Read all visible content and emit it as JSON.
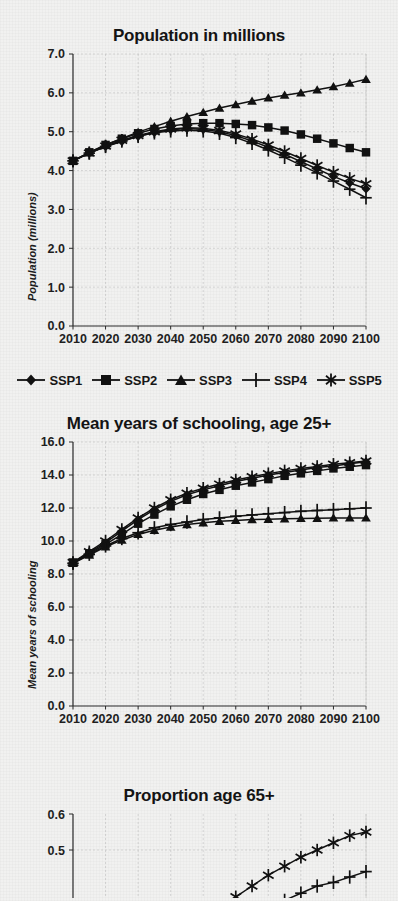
{
  "figure": {
    "style": "black-and-white scanned line chart figure",
    "background_color": "#f1f1f0",
    "ink_color": "#111111"
  },
  "legend": {
    "position": "below first panel",
    "items": [
      {
        "label": "SSP1",
        "marker": "diamond"
      },
      {
        "label": "SSP2",
        "marker": "square"
      },
      {
        "label": "SSP3",
        "marker": "triangle"
      },
      {
        "label": "SSP4",
        "marker": "plus"
      },
      {
        "label": "SSP5",
        "marker": "asterisk"
      }
    ]
  },
  "chart_data": [
    {
      "type": "line",
      "title": "Population in millions",
      "xlabel": "",
      "ylabel": "Population (millions)",
      "x": [
        2010,
        2015,
        2020,
        2025,
        2030,
        2035,
        2040,
        2045,
        2050,
        2055,
        2060,
        2065,
        2070,
        2075,
        2080,
        2085,
        2090,
        2095,
        2100
      ],
      "xlim": [
        2010,
        2100
      ],
      "ylim": [
        0.0,
        7.0
      ],
      "yticks": [
        "0.0",
        "1.0",
        "2.0",
        "3.0",
        "4.0",
        "5.0",
        "6.0",
        "7.0"
      ],
      "xticks": [
        "2010",
        "2020",
        "2030",
        "2040",
        "2050",
        "2060",
        "2070",
        "2080",
        "2090",
        "2100"
      ],
      "grid": true,
      "series": [
        {
          "name": "SSP1",
          "marker": "diamond",
          "values": [
            4.25,
            4.45,
            4.62,
            4.75,
            4.88,
            4.98,
            5.05,
            5.08,
            5.06,
            5.0,
            4.9,
            4.76,
            4.6,
            4.42,
            4.23,
            4.04,
            3.85,
            3.68,
            3.53
          ]
        },
        {
          "name": "SSP2",
          "marker": "square",
          "values": [
            4.25,
            4.47,
            4.66,
            4.82,
            4.96,
            5.07,
            5.15,
            5.2,
            5.22,
            5.22,
            5.2,
            5.17,
            5.11,
            5.03,
            4.93,
            4.82,
            4.7,
            4.58,
            4.47
          ]
        },
        {
          "name": "SSP3",
          "marker": "triangle",
          "values": [
            4.25,
            4.47,
            4.66,
            4.83,
            4.99,
            5.13,
            5.27,
            5.39,
            5.5,
            5.61,
            5.7,
            5.79,
            5.87,
            5.94,
            6.0,
            6.08,
            6.16,
            6.25,
            6.35
          ]
        },
        {
          "name": "SSP4",
          "marker": "plus",
          "values": [
            4.25,
            4.45,
            4.62,
            4.76,
            4.88,
            4.97,
            5.02,
            5.04,
            5.02,
            4.96,
            4.85,
            4.7,
            4.53,
            4.34,
            4.14,
            3.94,
            3.73,
            3.52,
            3.3
          ]
        },
        {
          "name": "SSP5",
          "marker": "asterisk",
          "values": [
            4.25,
            4.45,
            4.63,
            4.78,
            4.9,
            5.0,
            5.07,
            5.1,
            5.09,
            5.03,
            4.94,
            4.81,
            4.66,
            4.49,
            4.31,
            4.13,
            3.96,
            3.8,
            3.66
          ]
        }
      ]
    },
    {
      "type": "line",
      "title": "Mean years of schooling, age 25+",
      "xlabel": "",
      "ylabel": "Mean years of schooling",
      "x": [
        2010,
        2015,
        2020,
        2025,
        2030,
        2035,
        2040,
        2045,
        2050,
        2055,
        2060,
        2065,
        2070,
        2075,
        2080,
        2085,
        2090,
        2095,
        2100
      ],
      "xlim": [
        2010,
        2100
      ],
      "ylim": [
        0.0,
        16.0
      ],
      "yticks": [
        "0.0",
        "2.0",
        "4.0",
        "6.0",
        "8.0",
        "10.0",
        "12.0",
        "14.0",
        "16.0"
      ],
      "xticks": [
        "2010",
        "2020",
        "2030",
        "2040",
        "2050",
        "2060",
        "2070",
        "2080",
        "2090",
        "2100"
      ],
      "grid": true,
      "series": [
        {
          "name": "SSP1",
          "marker": "diamond",
          "values": [
            8.7,
            9.3,
            9.9,
            10.6,
            11.3,
            11.9,
            12.4,
            12.8,
            13.1,
            13.35,
            13.6,
            13.8,
            14.0,
            14.15,
            14.3,
            14.45,
            14.55,
            14.68,
            14.8
          ]
        },
        {
          "name": "SSP2",
          "marker": "square",
          "values": [
            8.7,
            9.25,
            9.8,
            10.4,
            11.05,
            11.6,
            12.1,
            12.5,
            12.85,
            13.1,
            13.35,
            13.55,
            13.75,
            13.95,
            14.1,
            14.25,
            14.4,
            14.5,
            14.6
          ]
        },
        {
          "name": "SSP3",
          "marker": "triangle",
          "values": [
            8.65,
            9.15,
            9.65,
            10.05,
            10.4,
            10.65,
            10.85,
            11.0,
            11.1,
            11.2,
            11.25,
            11.3,
            11.32,
            11.35,
            11.37,
            11.38,
            11.4,
            11.4,
            11.4
          ]
        },
        {
          "name": "SSP4",
          "marker": "plus",
          "values": [
            8.65,
            9.2,
            9.7,
            10.15,
            10.5,
            10.8,
            11.0,
            11.15,
            11.3,
            11.4,
            11.5,
            11.58,
            11.65,
            11.72,
            11.8,
            11.85,
            11.9,
            11.95,
            12.0
          ]
        },
        {
          "name": "SSP5",
          "marker": "asterisk",
          "values": [
            8.7,
            9.35,
            10.0,
            10.7,
            11.4,
            12.0,
            12.5,
            12.9,
            13.2,
            13.45,
            13.7,
            13.9,
            14.08,
            14.25,
            14.4,
            14.52,
            14.65,
            14.75,
            14.85
          ]
        }
      ]
    },
    {
      "type": "line",
      "title": "Proportion age 65+",
      "xlabel": "",
      "ylabel": "",
      "x": [
        2010,
        2015,
        2020,
        2025,
        2030,
        2035,
        2040,
        2045,
        2050,
        2055,
        2060,
        2065,
        2070,
        2075,
        2080,
        2085,
        2090,
        2095,
        2100
      ],
      "xlim": [
        2010,
        2100
      ],
      "ylim": [
        0.0,
        0.6
      ],
      "visible_yticks": [
        "0.6",
        "0.5"
      ],
      "grid": true,
      "cropped": "panel is cut off at the bottom edge of the image",
      "series": [
        {
          "name": "SSP5",
          "marker": "asterisk",
          "values": [
            0.09,
            0.1,
            0.12,
            0.14,
            0.17,
            0.2,
            0.23,
            0.26,
            0.3,
            0.33,
            0.37,
            0.4,
            0.43,
            0.455,
            0.48,
            0.5,
            0.52,
            0.54,
            0.55
          ]
        },
        {
          "name": "SSP4",
          "marker": "plus",
          "values": [
            0.09,
            0.1,
            0.11,
            0.13,
            0.15,
            0.17,
            0.19,
            0.22,
            0.24,
            0.27,
            0.29,
            0.32,
            0.34,
            0.36,
            0.38,
            0.4,
            0.41,
            0.425,
            0.44
          ]
        }
      ]
    }
  ]
}
